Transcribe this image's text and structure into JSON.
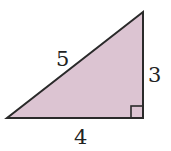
{
  "diagram": {
    "type": "right-triangle",
    "fill_color": "#dcc4d2",
    "stroke_color": "#2a2a2a",
    "vertices": {
      "bottom_left": [
        7,
        118
      ],
      "bottom_right": [
        143,
        118
      ],
      "top_right": [
        143,
        12
      ]
    },
    "labels": {
      "hypotenuse": "5",
      "vertical_leg": "3",
      "horizontal_leg": "4"
    },
    "right_angle_marker": true
  }
}
